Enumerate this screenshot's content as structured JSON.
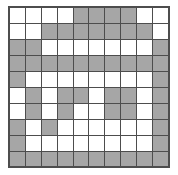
{
  "figure": {
    "name": "pixel-pattern-grid",
    "type": "binary-grid",
    "rows": 10,
    "cols": 10,
    "filled_color": "#a6a6a6",
    "empty_color": "#ffffff",
    "border_color": "#4d4d4d",
    "outer_border_color": "#4d4d4d",
    "legend": {
      "filled_label": "shaded",
      "empty_label": "blank"
    }
  },
  "chart_data": {
    "type": "heatmap",
    "title": "",
    "xlabel": "",
    "ylabel": "",
    "categories_x": [
      "1",
      "2",
      "3",
      "4",
      "5",
      "6",
      "7",
      "8",
      "9",
      "10"
    ],
    "categories_y": [
      "1",
      "2",
      "3",
      "4",
      "5",
      "6",
      "7",
      "8",
      "9",
      "10"
    ],
    "colorscale": [
      "#ffffff",
      "#a6a6a6"
    ],
    "values": [
      [
        0,
        0,
        0,
        0,
        1,
        1,
        1,
        1,
        0,
        0
      ],
      [
        0,
        0,
        1,
        1,
        1,
        1,
        1,
        1,
        1,
        0
      ],
      [
        1,
        1,
        0,
        0,
        0,
        0,
        0,
        0,
        0,
        1
      ],
      [
        1,
        1,
        1,
        1,
        1,
        1,
        1,
        1,
        1,
        1
      ],
      [
        1,
        0,
        0,
        0,
        0,
        0,
        0,
        0,
        0,
        1
      ],
      [
        0,
        1,
        0,
        1,
        1,
        0,
        1,
        1,
        0,
        1
      ],
      [
        0,
        1,
        0,
        1,
        0,
        0,
        1,
        1,
        0,
        1
      ],
      [
        1,
        0,
        1,
        0,
        0,
        0,
        0,
        0,
        0,
        1
      ],
      [
        1,
        0,
        0,
        0,
        0,
        0,
        0,
        0,
        0,
        1
      ],
      [
        1,
        1,
        1,
        1,
        1,
        1,
        1,
        1,
        1,
        1
      ]
    ]
  }
}
